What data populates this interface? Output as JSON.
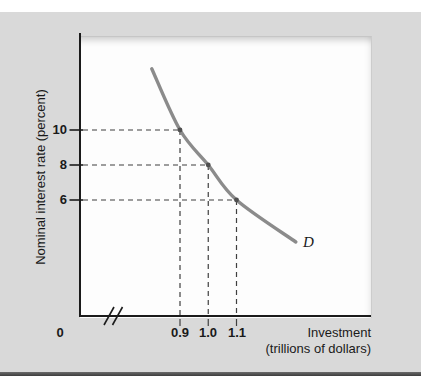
{
  "figure": {
    "y_axis_title": "Nominal interest rate (percent)",
    "x_axis_title_line1": "Investment",
    "x_axis_title_line2": "(trillions of dollars)",
    "origin_label": "0"
  },
  "chart_data": {
    "type": "line",
    "title": "",
    "xlabel": "Investment (trillions of dollars)",
    "ylabel": "Nominal interest rate (percent)",
    "series_label": "D",
    "series_description": "downward-sloping investment demand curve",
    "x_ticks": [
      0.9,
      1.0,
      1.1
    ],
    "x_tick_labels": [
      "0.9",
      "1.0",
      "1.1"
    ],
    "y_ticks": [
      10,
      8,
      6
    ],
    "y_tick_labels": [
      "10",
      "8",
      "6"
    ],
    "points": [
      {
        "x": 0.9,
        "y": 10
      },
      {
        "x": 1.0,
        "y": 8
      },
      {
        "x": 1.1,
        "y": 6
      }
    ],
    "curve_points": [
      [
        0.8,
        13.5
      ],
      [
        0.9,
        10
      ],
      [
        1.0,
        8
      ],
      [
        1.1,
        6
      ],
      [
        1.31,
        3.6
      ]
    ],
    "dashed_guides": true,
    "axis_break_on_x": true,
    "grid": false,
    "legend_position": "on-curve-end",
    "x_range_shown": [
      0.8,
      1.35
    ],
    "y_range_shown": [
      0,
      14
    ]
  },
  "colors": {
    "panel_bg": "#d9d9d9",
    "plot_bg": "#fdfdfd",
    "axis": "#1b1b1b",
    "curve": "#8b8b8b",
    "guide": "#3f3f3f",
    "marker": "#4f4f4f",
    "text": "#1a1a1a",
    "bottom_rule": "#4d4d4d"
  }
}
